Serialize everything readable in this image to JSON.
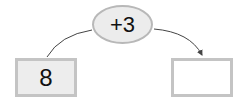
{
  "diagram": {
    "operator": "+3",
    "input_value": "8",
    "output_value": "",
    "colors": {
      "box_fill": "#ededed",
      "border": "#c4c4c4",
      "line": "#444444"
    }
  }
}
